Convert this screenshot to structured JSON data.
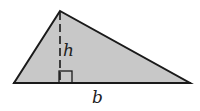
{
  "diagram": {
    "type": "triangle-area",
    "labels": {
      "height": "h",
      "base": "b"
    },
    "colors": {
      "fill": "#c8c8c8",
      "stroke": "#1a1a1a"
    }
  }
}
